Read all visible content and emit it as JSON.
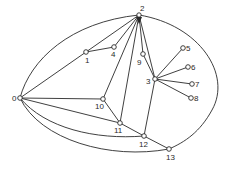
{
  "diagram": {
    "type": "graph",
    "nodes": [
      {
        "id": "0",
        "label": "0",
        "x": 20,
        "y": 98,
        "lx": 12,
        "ly": 101
      },
      {
        "id": "1",
        "label": "1",
        "x": 86,
        "y": 52,
        "lx": 85,
        "ly": 63
      },
      {
        "id": "2",
        "label": "2",
        "x": 139,
        "y": 15,
        "lx": 140,
        "ly": 11
      },
      {
        "id": "3",
        "label": "3",
        "x": 155,
        "y": 79,
        "lx": 146,
        "ly": 84
      },
      {
        "id": "4",
        "label": "4",
        "x": 114,
        "y": 47,
        "lx": 111,
        "ly": 57
      },
      {
        "id": "5",
        "label": "5",
        "x": 183,
        "y": 48,
        "lx": 186,
        "ly": 51
      },
      {
        "id": "6",
        "label": "6",
        "x": 188,
        "y": 67,
        "lx": 191,
        "ly": 70
      },
      {
        "id": "7",
        "label": "7",
        "x": 192,
        "y": 84,
        "lx": 195,
        "ly": 87
      },
      {
        "id": "8",
        "label": "8",
        "x": 191,
        "y": 98,
        "lx": 194,
        "ly": 101
      },
      {
        "id": "9",
        "label": "9",
        "x": 143,
        "y": 54,
        "lx": 137,
        "ly": 65
      },
      {
        "id": "10",
        "label": "10",
        "x": 103,
        "y": 99,
        "lx": 95,
        "ly": 109
      },
      {
        "id": "11",
        "label": "11",
        "x": 120,
        "y": 123,
        "lx": 114,
        "ly": 133
      },
      {
        "id": "12",
        "label": "12",
        "x": 144,
        "y": 136,
        "lx": 139,
        "ly": 147
      },
      {
        "id": "13",
        "label": "13",
        "x": 169,
        "y": 149,
        "lx": 166,
        "ly": 160
      }
    ],
    "edges": [
      {
        "from": "0",
        "to": "1",
        "path": "M20,98 L86,52"
      },
      {
        "from": "1",
        "to": "2",
        "path": "M86,52 L139,15"
      },
      {
        "from": "1",
        "to": "4",
        "path": "M86,52 L114,47"
      },
      {
        "from": "4",
        "to": "2",
        "path": "M114,47 L139,15"
      },
      {
        "from": "2",
        "to": "10",
        "path": "M139,15 L103,99"
      },
      {
        "from": "2",
        "to": "11",
        "path": "M139,15 L120,123"
      },
      {
        "from": "2",
        "to": "9",
        "path": "M139,15 L143,54"
      },
      {
        "from": "9",
        "to": "3",
        "path": "M143,54 L155,79"
      },
      {
        "from": "2",
        "to": "3",
        "path": "M139,15 L155,79"
      },
      {
        "from": "3",
        "to": "5",
        "path": "M155,79 L183,48"
      },
      {
        "from": "3",
        "to": "6",
        "path": "M155,79 L188,67"
      },
      {
        "from": "3",
        "to": "7",
        "path": "M155,79 L192,84"
      },
      {
        "from": "3",
        "to": "8",
        "path": "M155,79 L191,98"
      },
      {
        "from": "3",
        "to": "12",
        "path": "M155,79 L144,136"
      },
      {
        "from": "0",
        "to": "10",
        "path": "M20,98 L103,99"
      },
      {
        "from": "10",
        "to": "11",
        "path": "M103,99 L120,123"
      },
      {
        "from": "0",
        "to": "11",
        "path": "M20,98 L120,123"
      },
      {
        "from": "11",
        "to": "12",
        "path": "M120,123 L144,136"
      },
      {
        "from": "12",
        "to": "13",
        "path": "M144,136 L169,149"
      },
      {
        "from": "0",
        "to": "2",
        "path": "M20,98 C30,60 70,22 139,15"
      },
      {
        "from": "2",
        "to": "13",
        "path": "M139,15 C200,25 232,75 212,110 C200,132 185,142 169,149"
      },
      {
        "from": "0",
        "to": "12",
        "path": "M20,98 C45,128 95,140 144,136"
      },
      {
        "from": "0",
        "to": "13",
        "path": "M20,98 C40,140 110,160 169,149"
      }
    ],
    "colors": {
      "stroke": "#2a2a2a",
      "node_fill": "#ffffff",
      "background": "#ffffff"
    }
  }
}
